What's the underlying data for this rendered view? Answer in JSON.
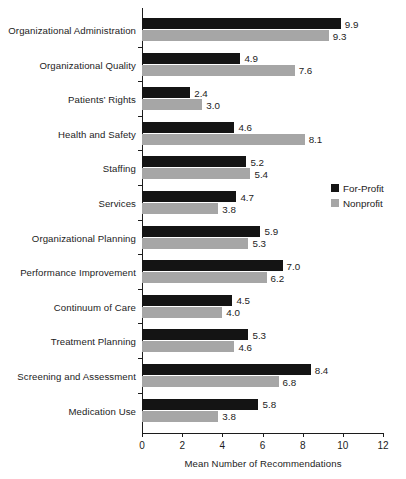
{
  "chart_data": {
    "type": "bar",
    "orientation": "horizontal",
    "title": "",
    "xlabel": "Mean Number of Recommendations",
    "ylabel": "",
    "xlim": [
      0,
      12
    ],
    "xticks": [
      "0",
      "2",
      "4",
      "6",
      "8",
      "10",
      "12"
    ],
    "grid": false,
    "legend_position": "right-middle",
    "categories": [
      "Organizational Administration",
      "Organizational Quality",
      "Patients’ Rights",
      "Health and Safety",
      "Staffing",
      "Services",
      "Organizational Planning",
      "Performance Improvement",
      "Continuum of Care",
      "Treatment Planning",
      "Screening and Assessment",
      "Medication Use"
    ],
    "series": [
      {
        "name": "For-Profit",
        "color": "#141414",
        "values": [
          9.9,
          4.9,
          2.4,
          4.6,
          5.2,
          4.7,
          5.9,
          7.0,
          4.5,
          5.3,
          8.4,
          5.8
        ],
        "labels": [
          "9.9",
          "4.9",
          "2.4",
          "4.6",
          "5.2",
          "4.7",
          "5.9",
          "7.0",
          "4.5",
          "5.3",
          "8.4",
          "5.8"
        ]
      },
      {
        "name": "Nonprofit",
        "color": "#a6a6a6",
        "values": [
          9.3,
          7.6,
          3.0,
          8.1,
          5.4,
          3.8,
          5.3,
          6.2,
          4.0,
          4.6,
          6.8,
          3.8
        ],
        "labels": [
          "9.3",
          "7.6",
          "3.0",
          "8.1",
          "5.4",
          "3.8",
          "5.3",
          "6.2",
          "4.0",
          "4.6",
          "6.8",
          "3.8"
        ]
      }
    ]
  },
  "legend": {
    "items": [
      {
        "label": "For-Profit",
        "swatch": "forprofit"
      },
      {
        "label": "Nonprofit",
        "swatch": "nonprofit"
      }
    ]
  },
  "axis": {
    "x_title": "Mean Number of Recommendations"
  }
}
